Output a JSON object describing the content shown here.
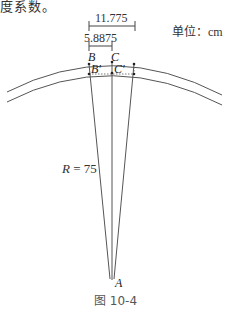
{
  "header_text": "度系数。",
  "unit_label": "单位：cm",
  "dimensions": {
    "outer": "11.775",
    "inner": "5.8875"
  },
  "points": {
    "B": "B",
    "C": "C",
    "B_prime": "B'",
    "C_prime": "C'",
    "A": "A"
  },
  "radius_label": {
    "symbol": "R",
    "equals": " = ",
    "value": "75"
  },
  "caption": "图 10-4",
  "colors": {
    "line": "#555555",
    "text": "#333333"
  }
}
